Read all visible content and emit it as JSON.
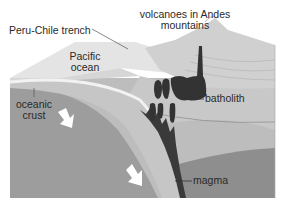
{
  "diagram": {
    "type": "cross-section",
    "labels": {
      "trench": "Peru-Chile trench",
      "volcanoes_line1": "volcanoes in Andes",
      "volcanoes_line2": "mountains",
      "ocean_line1": "Pacific",
      "ocean_line2": "ocean",
      "crust_line1": "oceanic",
      "crust_line2": "crust",
      "batholith": "batholith",
      "magma": "magma"
    },
    "colors": {
      "background": "#ffffff",
      "ocean_surface": "#e6e6e6",
      "oceanic_crust": "#c4c4c4",
      "mantle_lower": "#9c9c9c",
      "continental": "#bfbfbf",
      "continental_deep": "#8e8e8e",
      "mountain": "#d2d2d2",
      "magma": "#3a3a3a",
      "slab_edge": "#f4f4f4",
      "arrow": "#ffffff"
    }
  }
}
